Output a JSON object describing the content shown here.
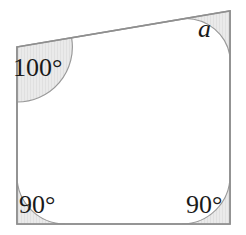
{
  "figure": {
    "kind": "quadrilateral-angle-diagram",
    "stroke_color": "#8f8f8f",
    "fill_color": "#ffffff",
    "arc_fill_color": "#e8e8e8",
    "arc_stroke_color": "#9a9a9a",
    "text_color": "#1a1a1a",
    "vertices": [
      {
        "name": "top-left",
        "x": 17,
        "y": 47
      },
      {
        "name": "top-right",
        "x": 230,
        "y": 11
      },
      {
        "name": "bottom-right",
        "x": 230,
        "y": 224
      },
      {
        "name": "bottom-left",
        "x": 17,
        "y": 224
      }
    ],
    "angles": [
      {
        "vertex": "top-left",
        "label": "100°",
        "value": 100,
        "known": true,
        "arc_radius": 55
      },
      {
        "vertex": "top-right",
        "label": "a",
        "value": null,
        "known": false,
        "arc_radius": 45
      },
      {
        "vertex": "bottom-right",
        "label": "90°",
        "value": 90,
        "known": true,
        "arc_radius": 48
      },
      {
        "vertex": "bottom-left",
        "label": "90°",
        "value": 90,
        "known": true,
        "arc_radius": 48
      }
    ]
  },
  "labels": {
    "top_left": "100°",
    "top_right": "a",
    "bottom_left": "90°",
    "bottom_right": "90°"
  }
}
